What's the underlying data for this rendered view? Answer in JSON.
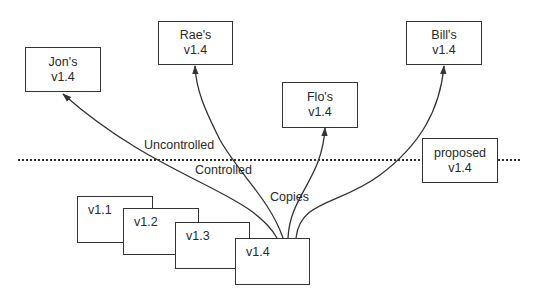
{
  "diagram": {
    "colors": {
      "stroke": "#333333",
      "text": "#2a2a2a",
      "background": "#ffffff"
    },
    "copies": [
      {
        "id": "jon",
        "owner": "Jon's",
        "version": "v1.4"
      },
      {
        "id": "rae",
        "owner": "Rae's",
        "version": "v1.4"
      },
      {
        "id": "flo",
        "owner": "Flo's",
        "version": "v1.4"
      },
      {
        "id": "bill",
        "owner": "Bill's",
        "version": "v1.4"
      }
    ],
    "proposed": {
      "line1": "proposed",
      "line2": "v1.4"
    },
    "versions": [
      "v1.1",
      "v1.2",
      "v1.3",
      "v1.4"
    ],
    "labels": {
      "uncontrolled": "Uncontrolled",
      "controlled": "Controlled",
      "copies": "Copies"
    }
  }
}
